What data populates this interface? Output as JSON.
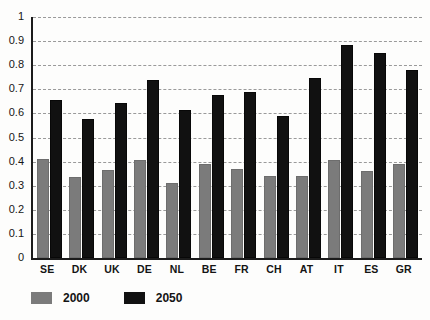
{
  "chart_data": {
    "type": "bar",
    "title": "",
    "subtitle": "",
    "xlabel": "",
    "ylabel": "",
    "ylim": [
      0,
      1
    ],
    "xlim_categories": 12,
    "grid": true,
    "grid_style": "dashed horizontal",
    "legend_position": "bottom-left",
    "categories": [
      "SE",
      "DK",
      "UK",
      "DE",
      "NL",
      "BE",
      "FR",
      "CH",
      "AT",
      "IT",
      "ES",
      "GR"
    ],
    "ytick_labels": [
      "1",
      "0.9",
      "0.8",
      "0.7",
      "0.6",
      "0.5",
      "0.4",
      "0.3",
      "0.2",
      "0.1",
      "0"
    ],
    "ytick_values": [
      1,
      0.9,
      0.8,
      0.7,
      0.6,
      0.5,
      0.4,
      0.3,
      0.2,
      0.1,
      0
    ],
    "series": [
      {
        "name": "2000",
        "color": "#7b7b7b",
        "values": [
          0.41,
          0.335,
          0.365,
          0.405,
          0.31,
          0.39,
          0.37,
          0.34,
          0.34,
          0.405,
          0.36,
          0.39
        ]
      },
      {
        "name": "2050",
        "color": "#111111",
        "values": [
          0.655,
          0.575,
          0.645,
          0.74,
          0.615,
          0.675,
          0.69,
          0.59,
          0.745,
          0.885,
          0.85,
          0.78
        ]
      }
    ]
  },
  "legend": {
    "entries": [
      {
        "label": "2000",
        "color": "#7b7b7b"
      },
      {
        "label": "2050",
        "color": "#111111"
      }
    ]
  },
  "colors": {
    "series_2000": "#7b7b7b",
    "series_2050": "#111111",
    "axis": "#1b1b1b",
    "gridline": "#9a9a9a",
    "background": "#fdfdfc",
    "text": "#141414"
  }
}
